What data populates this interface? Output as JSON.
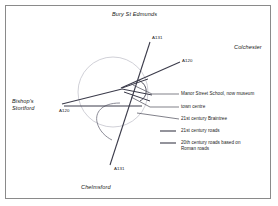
{
  "figure": {
    "frame_color": "#8a8a8a",
    "background": "#ffffff",
    "road_color": "#3b3b4a",
    "town_circle_color": "#b9b9c4",
    "leader_color": "#4a4a57"
  },
  "places": [
    {
      "name": "bury-st-edmunds",
      "label": "Bury St Edmunds",
      "x": 112,
      "y": 14,
      "lines": [
        "Bury St Edmunds"
      ]
    },
    {
      "name": "colchester",
      "label": "Colchester",
      "x": 234,
      "y": 47,
      "lines": [
        "Colchester"
      ]
    },
    {
      "name": "bishops-stortford",
      "label": "Bishop's Stortford",
      "x": 12,
      "y": 99,
      "lines": [
        "Bishop's",
        "Stortford"
      ]
    },
    {
      "name": "chelmsford",
      "label": "Chelmsford",
      "x": 81,
      "y": 185,
      "lines": [
        "Chelmsford"
      ]
    }
  ],
  "roads": [
    {
      "name": "a131-north",
      "label": "A131",
      "x": 152,
      "y": 37
    },
    {
      "name": "a120-east",
      "label": "A120",
      "x": 182,
      "y": 60
    },
    {
      "name": "a120-west",
      "label": "A120",
      "x": 59,
      "y": 110
    },
    {
      "name": "a131-south",
      "label": "A131",
      "x": 114,
      "y": 168
    }
  ],
  "annotations": [
    {
      "name": "manor-street-school",
      "label": "Manor Street School, now museum",
      "x": 182,
      "y": 93
    },
    {
      "name": "town-centre",
      "label": "town centre",
      "x": 182,
      "y": 106
    },
    {
      "name": "21st-century-braintree",
      "label": "21st century Braintree",
      "x": 182,
      "y": 118
    }
  ],
  "legend": {
    "items": [
      {
        "name": "21st-century-roads",
        "lines": [
          "21st century roads"
        ],
        "swatch_y": 131
      },
      {
        "name": "20th-century-roman-roads",
        "lines": [
          "20th century roads based on",
          "Roman roads"
        ],
        "swatch_y": 143
      }
    ]
  }
}
